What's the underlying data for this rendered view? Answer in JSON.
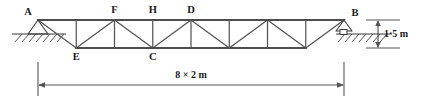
{
  "figure": {
    "type": "structural-truss-diagram"
  },
  "labels": {
    "left_support_node": "A",
    "right_support_node": "B",
    "top_chord_node_1": "F",
    "top_chord_node_2": "H",
    "top_chord_node_3": "D",
    "bottom_chord_node_1": "E",
    "bottom_chord_node_2": "C"
  },
  "dimensions": {
    "span_label": "8 × 2 m",
    "height_label": "1·5 m"
  },
  "colors": {
    "chord": "#4d4d4d",
    "web": "#555555",
    "support": "#3a3a3a",
    "dimension": "#555555",
    "text": "#1a1a1a",
    "background": "#ffffff"
  },
  "geometry": {
    "span_panels": 8,
    "panel_length_m": 2,
    "truss_height_m": 1.5,
    "top_chord_y_px": 20,
    "bottom_chord_y_px": 48,
    "left_node_x_px": 38,
    "right_node_x_px": 344
  },
  "supports": {
    "left": "pin-support",
    "right": "roller-support"
  }
}
